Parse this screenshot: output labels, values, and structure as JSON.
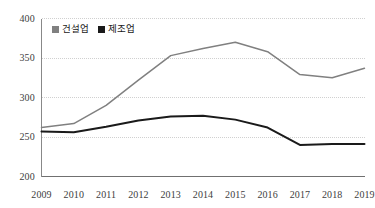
{
  "chart_data": {
    "type": "line",
    "title": "",
    "subtitle": "",
    "xlabel": "",
    "ylabel": "",
    "categories": [
      "2009",
      "2010",
      "2011",
      "2012",
      "2013",
      "2014",
      "2015",
      "2016",
      "2017",
      "2018",
      "2019"
    ],
    "x": [
      2009,
      2010,
      2011,
      2012,
      2013,
      2014,
      2015,
      2016,
      2017,
      2018,
      2019
    ],
    "series": [
      {
        "name": "건설업",
        "color": "#808080",
        "values": [
          262,
          267,
          290,
          322,
          353,
          362,
          370,
          358,
          329,
          325,
          337
        ]
      },
      {
        "name": "제조업",
        "color": "#1a1a1a",
        "values": [
          257,
          256,
          263,
          271,
          276,
          277,
          272,
          262,
          240,
          241,
          241
        ]
      }
    ],
    "ylim": [
      200,
      400
    ],
    "yticks": [
      200,
      250,
      300,
      350,
      400
    ],
    "ytick_labels": [
      "200",
      "250",
      "300",
      "350",
      "400"
    ],
    "grid": "horizontal",
    "legend_position": "top-left",
    "annotations": []
  },
  "legend": {
    "entries": [
      {
        "label": "건설업",
        "color": "#808080",
        "marker": "square-swatch"
      },
      {
        "label": "제조업",
        "color": "#1a1a1a",
        "marker": "square-swatch"
      }
    ]
  }
}
